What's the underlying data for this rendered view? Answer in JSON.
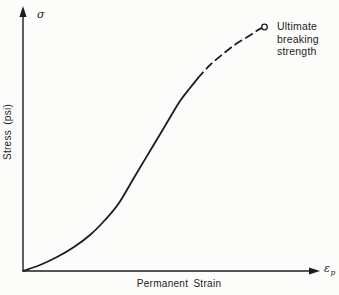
{
  "figure": {
    "sigma_label": "σ",
    "stress_axis_label": "Stress (psi)",
    "strain_axis_label": "Permanent Strain",
    "epsilon_label": "ε",
    "epsilon_subscript": "p",
    "annotation_lines": [
      "Ultimate",
      "breaking",
      "strength"
    ]
  },
  "colors": {
    "ink": "#1c1c1c",
    "paper": "#fcfcfa"
  },
  "chart_data": {
    "type": "line",
    "title": "",
    "xlabel": "Permanent Strain",
    "ylabel": "Stress (psi)",
    "x_axis_symbol": "εp",
    "y_axis_symbol": "σ",
    "grid": false,
    "legend": "none",
    "axes_quantitative": false,
    "series": [
      {
        "name": "stress-strain curve (solid portion)",
        "style": "solid",
        "points_px": [
          [
            23,
            271
          ],
          [
            40,
            265
          ],
          [
            57,
            257
          ],
          [
            74,
            247
          ],
          [
            90,
            235
          ],
          [
            105,
            220
          ],
          [
            119,
            203
          ],
          [
            135,
            176
          ],
          [
            150,
            151
          ],
          [
            165,
            126
          ],
          [
            180,
            101
          ],
          [
            190,
            88
          ],
          [
            198,
            78
          ]
        ]
      },
      {
        "name": "extrapolation to failure (dashed portion)",
        "style": "dashed",
        "points_px": [
          [
            198,
            78
          ],
          [
            210,
            65
          ],
          [
            223,
            54
          ],
          [
            236,
            44
          ],
          [
            249,
            36
          ],
          [
            258,
            30
          ],
          [
            262,
            28
          ]
        ]
      }
    ],
    "end_marker": {
      "shape": "open-circle",
      "x_px": 264.5,
      "y_px": 27,
      "radius_px": 2.8,
      "label": "Ultimate breaking strength"
    }
  }
}
